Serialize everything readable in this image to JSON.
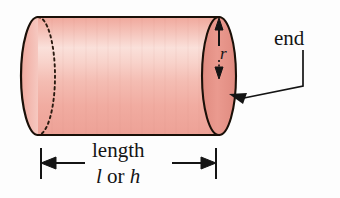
{
  "figure": {
    "shape": "cylinder",
    "background_color": "#fdfdfd",
    "outline_color": "#1a1008",
    "body_fill_light": "#f8d4cd",
    "body_fill_mid": "#f3b6ad",
    "body_fill_dark": "#eda196",
    "end_face_fill": "#e8958a",
    "end_face_fill_edge": "#dd8478",
    "hidden_edge_style": "dotted",
    "labels": {
      "end": "end",
      "radius": "r",
      "length": "length",
      "length_symbol_first": "l",
      "length_symbol_conjunction": " or ",
      "length_symbol_second": "h"
    },
    "annotations": [
      {
        "name": "radius-arrow",
        "label": "r",
        "description": "double-headed vertical arrow on right end face",
        "orientation": "vertical"
      },
      {
        "name": "end-leader",
        "label": "end",
        "description": "leader line from end label to right circular face",
        "orientation": "elbow"
      },
      {
        "name": "length-dimension",
        "label": "length l or h",
        "description": "horizontal double-headed dimension arrow below cylinder",
        "orientation": "horizontal"
      }
    ],
    "geometry": {
      "body_left_x": 38,
      "body_right_x": 236,
      "body_top_y": 17,
      "body_bottom_y": 135,
      "ellipse_rx": 17,
      "ellipse_ry": 59,
      "dimension_line_y": 163,
      "dimension_left_x": 40,
      "dimension_right_x": 217
    }
  }
}
